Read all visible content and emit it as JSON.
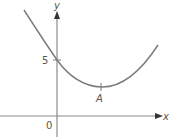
{
  "figure": {
    "type": "function-graph"
  },
  "axes": {
    "x_label": "x",
    "y_label": "y",
    "origin_label": "0"
  },
  "annotations": {
    "y_intercept_label": "5",
    "minimum_point_label": "A"
  },
  "colors": {
    "curve": "#7a7a7a",
    "axis": "#8a8a8a",
    "text": "#555555"
  }
}
